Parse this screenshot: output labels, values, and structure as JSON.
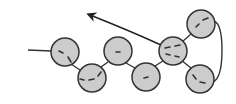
{
  "diagram": {
    "colors": {
      "node_fill": "#cccccc",
      "stroke": "#333333",
      "background": "#ffffff"
    },
    "node_radius": 14,
    "nodes": [
      {
        "id": "n1",
        "cx": 65,
        "cy": 52
      },
      {
        "id": "n2",
        "cx": 92,
        "cy": 78
      },
      {
        "id": "n3",
        "cx": 118,
        "cy": 51
      },
      {
        "id": "n4",
        "cx": 146,
        "cy": 77
      },
      {
        "id": "n5",
        "cx": 173,
        "cy": 51
      },
      {
        "id": "n6",
        "cx": 201,
        "cy": 24
      },
      {
        "id": "n7",
        "cx": 200,
        "cy": 79
      }
    ],
    "lead_line": {
      "x1": 28,
      "y1": 50,
      "x2": 51,
      "y2": 51
    },
    "arrow": {
      "label": ""
    }
  }
}
